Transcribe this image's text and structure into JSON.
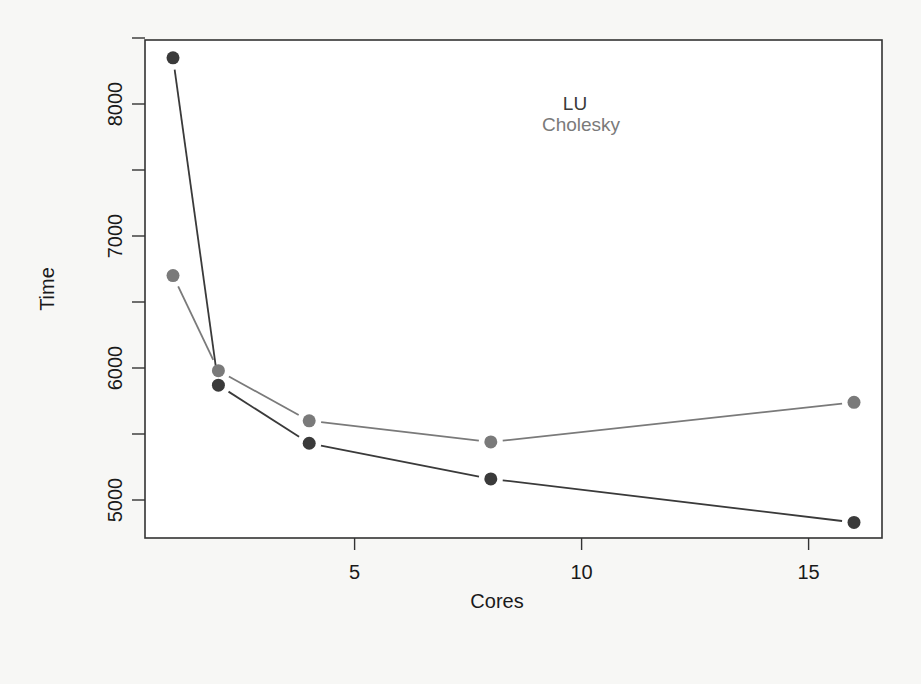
{
  "chart_data": {
    "type": "line",
    "title": "",
    "xlabel": "Cores",
    "ylabel": "Time",
    "x": [
      1,
      2,
      4,
      8,
      16
    ],
    "series": [
      {
        "name": "LU",
        "color": "#3a3a3a",
        "values": [
          8350,
          5870,
          5430,
          5160,
          4830
        ]
      },
      {
        "name": "Cholesky",
        "color": "#7a7a7a",
        "values": [
          6700,
          5980,
          5600,
          5440,
          5740
        ]
      }
    ],
    "xticks": [
      5,
      10,
      15
    ],
    "xtick_labels": [
      "5",
      "10",
      "15"
    ],
    "yticks": [
      5000,
      5500,
      6000,
      6500,
      7000,
      7500,
      8000,
      8500
    ],
    "ytick_labels": [
      "5000",
      "",
      "6000",
      "",
      "7000",
      "",
      "8000",
      ""
    ],
    "xlim": [
      0.4,
      16.6
    ],
    "ylim": [
      4720,
      8490
    ],
    "grid": false,
    "legend_position": "top-center (inside plot, text only, overlapping)",
    "markers": "filled circles"
  },
  "axes": {
    "xlabel": "Cores",
    "ylabel": "Time"
  },
  "legend": {
    "items": [
      {
        "label": "LU",
        "color": "#3a3a3a"
      },
      {
        "label": "Cholesky",
        "color": "#7a7a7a"
      }
    ]
  }
}
